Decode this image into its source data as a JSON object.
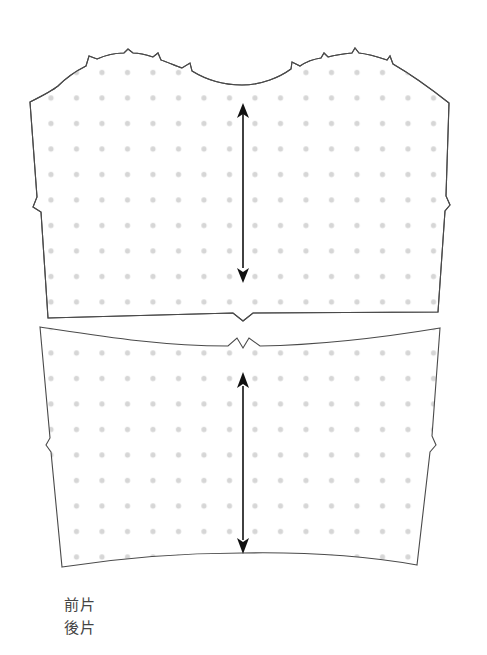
{
  "diagram": {
    "type": "sewing-pattern",
    "pieces": [
      {
        "id": "front",
        "label": "前片",
        "grainline": "vertical double-headed arrow",
        "notches": [
          "left side",
          "right side",
          "bottom center",
          "neckline/shoulder x6"
        ]
      },
      {
        "id": "back",
        "label": "後片",
        "grainline": "vertical double-headed arrow",
        "notches": [
          "left side",
          "right side",
          "top center double notch"
        ]
      }
    ],
    "fill_pattern": "light gray dot grid",
    "colors": {
      "outline": "#4a4a4a",
      "dots": "#d6d6d6",
      "arrow": "#111111",
      "background": "#ffffff",
      "label_text": "#444444"
    }
  },
  "labels": {
    "front": "前片",
    "back": "後片"
  }
}
